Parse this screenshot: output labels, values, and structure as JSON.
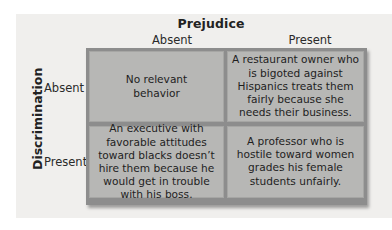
{
  "diagram": {
    "column_axis_title": "Prejudice",
    "row_axis_title": "Discrimination",
    "columns": [
      "Absent",
      "Present"
    ],
    "rows": [
      "Absent",
      "Present"
    ],
    "cells": [
      [
        "No relevant behavior",
        "A restaurant owner who is bigoted against Hispanics treats them fairly because she needs their business."
      ],
      [
        "An executive with favorable attitudes toward blacks doesn’t hire them because he would get in trouble with his boss.",
        "A professor who is hostile toward women grades his female students unfairly."
      ]
    ]
  },
  "colors": {
    "panel_background": "#f0efed",
    "cell_fill": "#b7b7b5",
    "grid_frame": "#8d8d8d",
    "text": "#1e1e1e"
  }
}
